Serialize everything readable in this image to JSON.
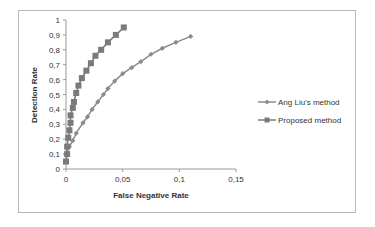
{
  "chart_data": {
    "type": "line",
    "title": "",
    "xlabel": "False Negative Rate",
    "ylabel": "Detection Rate",
    "xlim": [
      0,
      0.15
    ],
    "ylim": [
      0,
      1
    ],
    "x_ticks": [
      "0",
      "0,05",
      "0,1",
      "0,15"
    ],
    "y_ticks": [
      "0",
      "0,1",
      "0,2",
      "0,3",
      "0,4",
      "0,5",
      "0,6",
      "0,7",
      "0,8",
      "0,9",
      "1"
    ],
    "grid": false,
    "legend_position": "right",
    "series": [
      {
        "name": "Ang Liu's method",
        "marker": "diamond",
        "color": "#8c8c8c",
        "x": [
          0.0,
          0.003,
          0.006,
          0.009,
          0.015,
          0.019,
          0.023,
          0.028,
          0.033,
          0.037,
          0.043,
          0.05,
          0.058,
          0.066,
          0.075,
          0.085,
          0.097,
          0.11
        ],
        "y": [
          0.1,
          0.15,
          0.19,
          0.24,
          0.31,
          0.35,
          0.4,
          0.45,
          0.5,
          0.54,
          0.59,
          0.64,
          0.68,
          0.72,
          0.77,
          0.81,
          0.85,
          0.89
        ]
      },
      {
        "name": "Proposed method",
        "marker": "square",
        "color": "#7a7a7a",
        "x": [
          0.0,
          0.001,
          0.001,
          0.002,
          0.003,
          0.004,
          0.004,
          0.006,
          0.007,
          0.009,
          0.011,
          0.014,
          0.018,
          0.022,
          0.026,
          0.031,
          0.037,
          0.044,
          0.051
        ],
        "y": [
          0.05,
          0.1,
          0.15,
          0.21,
          0.26,
          0.31,
          0.36,
          0.41,
          0.45,
          0.51,
          0.56,
          0.61,
          0.66,
          0.71,
          0.76,
          0.8,
          0.85,
          0.9,
          0.95
        ]
      }
    ]
  },
  "legend": {
    "items": [
      {
        "label": "Ang Liu's method",
        "marker": "diamond"
      },
      {
        "label": "Proposed method",
        "marker": "square"
      }
    ]
  }
}
